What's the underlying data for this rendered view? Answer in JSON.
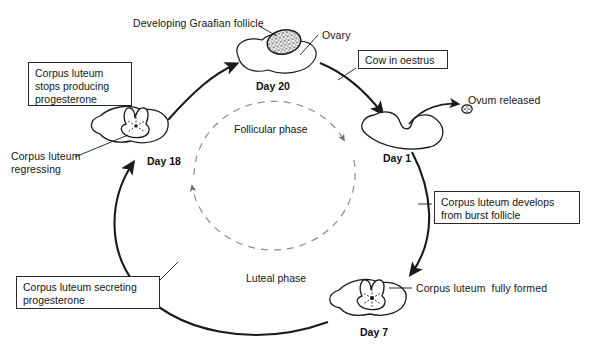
{
  "diagram": {
    "background_color": "#ffffff",
    "ink_color": "#1a1a1a",
    "dashed_color": "#8a8a8a"
  },
  "callouts": [
    {
      "id": "cl-stops",
      "text": "Corpus luteum\nstops producing\nprogesterone",
      "x": 28,
      "y": 62,
      "w": 104,
      "h": 44
    },
    {
      "id": "cow-oestrus",
      "text": "Cow in oestrus",
      "x": 358,
      "y": 50,
      "w": 90,
      "h": 19
    },
    {
      "id": "cl-develops",
      "text": "Corpus luteum develops\nfrom burst follicle",
      "x": 434,
      "y": 191,
      "w": 146,
      "h": 33
    },
    {
      "id": "cl-secreting",
      "text": "Corpus luteum secreting\nprogesterone",
      "x": 16,
      "y": 276,
      "w": 144,
      "h": 33
    }
  ],
  "annotations": [
    {
      "id": "developing-graafian-follicle",
      "text": "Developing Graafian follicle",
      "x": 133,
      "y": 17
    },
    {
      "id": "ovary",
      "text": "Ovary",
      "x": 322,
      "y": 29
    },
    {
      "id": "ovum-released",
      "text": "Ovum released",
      "x": 468,
      "y": 94
    },
    {
      "id": "corpus-luteum-regressing",
      "text": "Corpus luteum\nregressing",
      "x": 11,
      "y": 150
    },
    {
      "id": "corpus-luteum-fully-formed",
      "text": "Corpus luteum  fully formed",
      "x": 416,
      "y": 282
    }
  ],
  "phases": [
    {
      "id": "follicular-phase",
      "label": "Follicular phase",
      "x": 234,
      "y": 123
    },
    {
      "id": "luteal-phase",
      "label": "Luteal phase",
      "x": 246,
      "y": 272
    }
  ],
  "stages": [
    {
      "id": "day-20",
      "day_label": "Day 20",
      "label_x": 256,
      "label_y": 80,
      "ovary_x": 235,
      "ovary_y": 33,
      "state": "developing-graafian-follicle"
    },
    {
      "id": "day-1",
      "day_label": "Day 1",
      "label_x": 383,
      "label_y": 152,
      "ovary_x": 360,
      "ovary_y": 108,
      "state": "burst-follicle"
    },
    {
      "id": "day-7",
      "day_label": "Day 7",
      "label_x": 360,
      "label_y": 326,
      "ovary_x": 330,
      "ovary_y": 275,
      "state": "corpus-luteum-fully-formed"
    },
    {
      "id": "day-18",
      "day_label": "Day 18",
      "label_x": 147,
      "label_y": 155,
      "ovary_x": 106,
      "ovary_y": 110,
      "state": "corpus-luteum-regressing"
    }
  ],
  "icons": {
    "ovary": "ovary-icon",
    "follicle": "graafian-follicle-icon",
    "corpus_luteum": "corpus-luteum-icon",
    "ovum": "ovum-icon",
    "arrow": "curved-arrow-icon"
  }
}
